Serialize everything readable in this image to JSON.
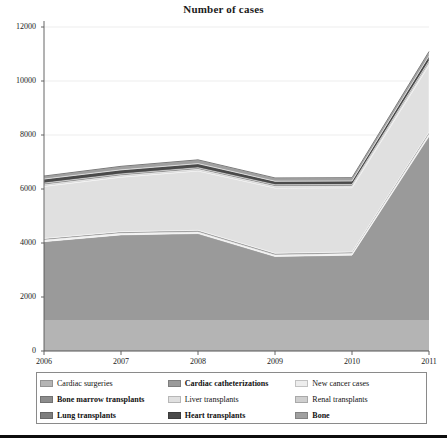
{
  "chart_data": {
    "type": "area",
    "title": "Number of cases",
    "xlabel": "",
    "ylabel": "",
    "stacked": true,
    "grid": true,
    "legend_position": "bottom",
    "x": [
      "2006",
      "2007",
      "2008",
      "2009",
      "2010",
      "2011"
    ],
    "xlim": [
      2006,
      2011
    ],
    "ylim": [
      0,
      12000
    ],
    "yticks": [
      "0",
      "2000",
      "4000",
      "6000",
      "8000",
      "10000",
      "12000"
    ],
    "ytick_values": [
      0,
      2000,
      4000,
      6000,
      8000,
      10000,
      12000
    ],
    "series": [
      {
        "name": "Cardiac surgeries",
        "color": "#b4b4b4",
        "values": [
          1150,
          1150,
          1150,
          1150,
          1150,
          1150
        ]
      },
      {
        "name": "Cardiac catheterizations",
        "color": "#9a9a9a",
        "values": [
          2900,
          3150,
          3200,
          2350,
          2400,
          6800
        ]
      },
      {
        "name": "New cancer cases",
        "color": "#ededed",
        "values": [
          60,
          60,
          60,
          60,
          60,
          80
        ]
      },
      {
        "name": "Bone marrow transplants",
        "color": "#8c8c8c",
        "values": [
          60,
          60,
          60,
          60,
          60,
          80
        ]
      },
      {
        "name": "Liver transplants",
        "color": "#e0e0e0",
        "values": [
          1930,
          2020,
          2200,
          2420,
          2380,
          2480
        ]
      },
      {
        "name": "Renal transplants",
        "color": "#cfcfcf",
        "values": [
          60,
          60,
          60,
          60,
          60,
          80
        ]
      },
      {
        "name": "Lung transplants",
        "color": "#7d7d7d",
        "values": [
          60,
          60,
          60,
          60,
          60,
          80
        ]
      },
      {
        "name": "Heart transplants",
        "color": "#4a4a4a",
        "values": [
          150,
          150,
          150,
          130,
          130,
          180
        ]
      },
      {
        "name": "Bone",
        "color": "#a0a0a0",
        "values": [
          110,
          130,
          140,
          120,
          120,
          160
        ]
      }
    ],
    "stack_top_values": [
      6420,
      6790,
      7020,
      6350,
      6360,
      11030
    ]
  },
  "legend": {
    "items": [
      {
        "label": "Cardiac surgeries",
        "color": "#b4b4b4",
        "bold": false
      },
      {
        "label": "Cardiac catheterizations",
        "color": "#9a9a9a",
        "bold": true
      },
      {
        "label": "New cancer cases",
        "color": "#ededed",
        "bold": false
      },
      {
        "label": "Bone marrow transplants",
        "color": "#8c8c8c",
        "bold": true
      },
      {
        "label": "Liver transplants",
        "color": "#e0e0e0",
        "bold": false
      },
      {
        "label": "Renal transplants",
        "color": "#cfcfcf",
        "bold": false
      },
      {
        "label": "Lung transplants",
        "color": "#7d7d7d",
        "bold": true
      },
      {
        "label": "Heart transplants",
        "color": "#4a4a4a",
        "bold": true
      },
      {
        "label": "Bone",
        "color": "#a0a0a0",
        "bold": true
      }
    ]
  }
}
